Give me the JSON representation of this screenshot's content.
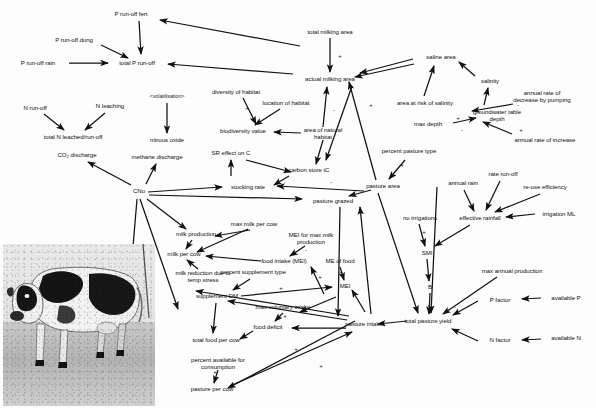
{
  "diagram": {
    "type": "causal-influence-diagram",
    "background_color": "#fdfdfd",
    "ink_color": "#101010",
    "photo": {
      "name": "holstein-cow-photograph",
      "description": "black and white photograph of a Holstein dairy cow standing on gravel"
    },
    "nodes": [
      {
        "id": "p_runoff_fert",
        "label": "P run-off fert",
        "x": 131,
        "y": 14
      },
      {
        "id": "p_runoff_dung",
        "label": "P run-off dung",
        "x": 74,
        "y": 40
      },
      {
        "id": "p_runoff_rain",
        "label": "P run-off rain",
        "x": 38,
        "y": 63
      },
      {
        "id": "total_p_runoff",
        "label": "total P run-off",
        "x": 137,
        "y": 63
      },
      {
        "id": "n_runoff",
        "label": "N run-off",
        "x": 35,
        "y": 108
      },
      {
        "id": "n_leaching",
        "label": "N leaching",
        "x": 110,
        "y": 106
      },
      {
        "id": "total_n_leached",
        "label": "total N leached/run-off",
        "x": 73,
        "y": 137
      },
      {
        "id": "co2_discharge",
        "label": "CO₂ discharge",
        "x": 77,
        "y": 155
      },
      {
        "id": "methane_discharge",
        "label": "methane discharge",
        "x": 157,
        "y": 157
      },
      {
        "id": "volatilisation",
        "label": "<volatilisation>",
        "x": 167,
        "y": 97
      },
      {
        "id": "nitrous_oxide",
        "label": "nitrous oxide",
        "x": 167,
        "y": 140
      },
      {
        "id": "cno",
        "label": "CNo",
        "x": 139,
        "y": 191
      },
      {
        "id": "total_milking_area",
        "label": "total milking area",
        "x": 330,
        "y": 32
      },
      {
        "id": "actual_milking_area",
        "label": "actual milking area",
        "x": 330,
        "y": 79
      },
      {
        "id": "diversity_habitat",
        "label": "diversity of habitat",
        "x": 236,
        "y": 92
      },
      {
        "id": "location_habitat",
        "label": "location of habitat",
        "x": 286,
        "y": 103
      },
      {
        "id": "biodiversity_value",
        "label": "biodiversity value",
        "x": 243,
        "y": 131
      },
      {
        "id": "area_natural_habitat",
        "label": "area of natural habitat",
        "x": 323,
        "y": 133,
        "multiline": true
      },
      {
        "id": "sr_effect_c",
        "label": "SR effect on C",
        "x": 231,
        "y": 153
      },
      {
        "id": "carbon_store",
        "label": "carbon store tC",
        "x": 309,
        "y": 170
      },
      {
        "id": "stocking_rate",
        "label": "stocking rate",
        "x": 248,
        "y": 187
      },
      {
        "id": "pasture_grazed",
        "label": "pasture grazed",
        "x": 333,
        "y": 201
      },
      {
        "id": "saline_area",
        "label": "saline area",
        "x": 441,
        "y": 57
      },
      {
        "id": "salinity",
        "label": "salinity",
        "x": 490,
        "y": 81
      },
      {
        "id": "area_risk_salinity",
        "label": "area at risk of salinity",
        "x": 425,
        "y": 103
      },
      {
        "id": "annual_decrease_pump",
        "label": "annual rate of decrease by pumping",
        "x": 542,
        "y": 96,
        "multiline": true
      },
      {
        "id": "groundwater_depth",
        "label": "groundwater table depth",
        "x": 497,
        "y": 115,
        "multiline": true
      },
      {
        "id": "max_depth",
        "label": "max depth",
        "x": 428,
        "y": 124
      },
      {
        "id": "annual_rate_increase",
        "label": "annual rate of increase",
        "x": 545,
        "y": 140
      },
      {
        "id": "percent_pasture_type",
        "label": "percent pasture type",
        "x": 409,
        "y": 151,
        "multiline": true
      },
      {
        "id": "pasture_area",
        "label": "pasture area",
        "x": 383,
        "y": 186
      },
      {
        "id": "annual_rain",
        "label": "annual rain",
        "x": 463,
        "y": 183
      },
      {
        "id": "rate_runoff",
        "label": "rate run-off",
        "x": 503,
        "y": 174
      },
      {
        "id": "reuse_efficiency",
        "label": "re-use efficiency",
        "x": 545,
        "y": 187
      },
      {
        "id": "effective_rainfall",
        "label": "effective rainfall",
        "x": 480,
        "y": 218
      },
      {
        "id": "irrigation_ml",
        "label": "irrigation ML",
        "x": 559,
        "y": 214
      },
      {
        "id": "no_irrigations",
        "label": "no irrigations",
        "x": 420,
        "y": 218
      },
      {
        "id": "smi",
        "label": "SMI",
        "x": 427,
        "y": 253
      },
      {
        "id": "b_node",
        "label": "B",
        "x": 430,
        "y": 287
      },
      {
        "id": "max_annual_production",
        "label": "max annual production",
        "x": 512,
        "y": 271
      },
      {
        "id": "p_factor",
        "label": "P factor",
        "x": 500,
        "y": 300
      },
      {
        "id": "available_p",
        "label": "available P",
        "x": 566,
        "y": 298
      },
      {
        "id": "n_factor",
        "label": "N factor",
        "x": 500,
        "y": 340
      },
      {
        "id": "available_n",
        "label": "available N",
        "x": 566,
        "y": 338
      },
      {
        "id": "total_pasture_yield",
        "label": "total pasture yield",
        "x": 428,
        "y": 321
      },
      {
        "id": "milk_production",
        "label": "milk production",
        "x": 196,
        "y": 234
      },
      {
        "id": "max_milk_per_cow",
        "label": "max milk per cow",
        "x": 254,
        "y": 224
      },
      {
        "id": "milk_per_cow",
        "label": "milk per cow",
        "x": 184,
        "y": 254
      },
      {
        "id": "mei_max_milk",
        "label": "MEI for max milk production",
        "x": 311,
        "y": 238,
        "multiline": true
      },
      {
        "id": "food_intake_mei",
        "label": "food intake (MEI)",
        "x": 284,
        "y": 261
      },
      {
        "id": "me_of_food",
        "label": "ME of food",
        "x": 340,
        "y": 261
      },
      {
        "id": "mei",
        "label": "MEI",
        "x": 345,
        "y": 286
      },
      {
        "id": "milk_reduction_temp",
        "label": "milk reduction due to temp stress",
        "x": 203,
        "y": 276,
        "multiline": true
      },
      {
        "id": "percent_supplement",
        "label": "percent supplement type",
        "x": 253,
        "y": 272
      },
      {
        "id": "supplement_dm",
        "label": "supplement DM",
        "x": 217,
        "y": 296
      },
      {
        "id": "max_voluntary_intake",
        "label": "max voluntary intake",
        "x": 283,
        "y": 307
      },
      {
        "id": "food_deficit",
        "label": "food deficit",
        "x": 268,
        "y": 327
      },
      {
        "id": "pasture_intake",
        "label": "pasture intake",
        "x": 364,
        "y": 324
      },
      {
        "id": "total_food_per_cow",
        "label": "total food per cow",
        "x": 216,
        "y": 340
      },
      {
        "id": "percent_available",
        "label": "percent available for consumption",
        "x": 218,
        "y": 363,
        "multiline": true
      },
      {
        "id": "pasture_per_cow",
        "label": "pasture per cow",
        "x": 212,
        "y": 389
      }
    ],
    "signs": [
      {
        "label": "+",
        "x": 340,
        "y": 56
      },
      {
        "label": "+",
        "x": 247,
        "y": 108
      },
      {
        "label": "-",
        "x": 334,
        "y": 110
      },
      {
        "label": "+",
        "x": 371,
        "y": 105
      },
      {
        "label": "+",
        "x": 458,
        "y": 118
      },
      {
        "label": "-",
        "x": 462,
        "y": 130
      },
      {
        "label": "-",
        "x": 518,
        "y": 105
      },
      {
        "label": "+",
        "x": 521,
        "y": 130
      },
      {
        "label": "+",
        "x": 402,
        "y": 165
      },
      {
        "label": "+",
        "x": 424,
        "y": 232
      },
      {
        "label": "-",
        "x": 331,
        "y": 182
      },
      {
        "label": "-",
        "x": 306,
        "y": 250
      },
      {
        "label": "+",
        "x": 341,
        "y": 272
      },
      {
        "label": "+",
        "x": 320,
        "y": 277
      },
      {
        "label": "+",
        "x": 281,
        "y": 288
      },
      {
        "label": "+",
        "x": 285,
        "y": 316
      },
      {
        "label": "+",
        "x": 215,
        "y": 372
      },
      {
        "label": "+",
        "x": 296,
        "y": 349
      },
      {
        "label": "+",
        "x": 321,
        "y": 366
      },
      {
        "label": "-",
        "x": 455,
        "y": 307
      }
    ]
  }
}
